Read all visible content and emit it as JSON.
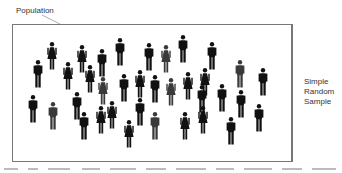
{
  "labels": {
    "population": "Population",
    "sample_lines": [
      "Simple",
      "Random",
      "Sample"
    ]
  },
  "colors": {
    "figure_dark": "#111111",
    "figure_gray": "#3a3a3a",
    "border": "#777777",
    "text": "#333333"
  },
  "figures": [
    {
      "type": "man",
      "x": 33,
      "y": 60,
      "shade": "dark"
    },
    {
      "type": "woman",
      "x": 47,
      "y": 42,
      "shade": "dark"
    },
    {
      "type": "woman",
      "x": 63,
      "y": 62,
      "shade": "dark"
    },
    {
      "type": "woman",
      "x": 77,
      "y": 45,
      "shade": "dark"
    },
    {
      "type": "woman",
      "x": 85,
      "y": 65,
      "shade": "dark"
    },
    {
      "type": "man",
      "x": 97,
      "y": 49,
      "shade": "dark"
    },
    {
      "type": "man",
      "x": 115,
      "y": 38,
      "shade": "dark"
    },
    {
      "type": "woman",
      "x": 98,
      "y": 77,
      "shade": "gray"
    },
    {
      "type": "man",
      "x": 119,
      "y": 74,
      "shade": "dark"
    },
    {
      "type": "woman",
      "x": 135,
      "y": 70,
      "shade": "dark"
    },
    {
      "type": "man",
      "x": 144,
      "y": 43,
      "shade": "dark"
    },
    {
      "type": "woman",
      "x": 161,
      "y": 45,
      "shade": "gray"
    },
    {
      "type": "man",
      "x": 150,
      "y": 75,
      "shade": "dark"
    },
    {
      "type": "woman",
      "x": 166,
      "y": 78,
      "shade": "gray"
    },
    {
      "type": "man",
      "x": 178,
      "y": 35,
      "shade": "dark"
    },
    {
      "type": "woman",
      "x": 183,
      "y": 72,
      "shade": "dark"
    },
    {
      "type": "man",
      "x": 207,
      "y": 42,
      "shade": "dark"
    },
    {
      "type": "man",
      "x": 197,
      "y": 85,
      "shade": "dark"
    },
    {
      "type": "woman",
      "x": 200,
      "y": 68,
      "shade": "dark"
    },
    {
      "type": "man",
      "x": 217,
      "y": 84,
      "shade": "dark"
    },
    {
      "type": "man",
      "x": 235,
      "y": 60,
      "shade": "gray"
    },
    {
      "type": "man",
      "x": 258,
      "y": 68,
      "shade": "dark"
    },
    {
      "type": "man",
      "x": 236,
      "y": 90,
      "shade": "dark"
    },
    {
      "type": "man",
      "x": 28,
      "y": 95,
      "shade": "dark"
    },
    {
      "type": "man",
      "x": 48,
      "y": 102,
      "shade": "gray"
    },
    {
      "type": "man",
      "x": 72,
      "y": 92,
      "shade": "dark"
    },
    {
      "type": "man",
      "x": 79,
      "y": 112,
      "shade": "dark"
    },
    {
      "type": "woman",
      "x": 96,
      "y": 106,
      "shade": "dark"
    },
    {
      "type": "woman",
      "x": 107,
      "y": 101,
      "shade": "dark"
    },
    {
      "type": "man",
      "x": 135,
      "y": 98,
      "shade": "dark"
    },
    {
      "type": "woman",
      "x": 124,
      "y": 120,
      "shade": "dark"
    },
    {
      "type": "man",
      "x": 150,
      "y": 112,
      "shade": "gray"
    },
    {
      "type": "woman",
      "x": 180,
      "y": 112,
      "shade": "dark"
    },
    {
      "type": "woman",
      "x": 198,
      "y": 106,
      "shade": "dark"
    },
    {
      "type": "man",
      "x": 226,
      "y": 117,
      "shade": "dark"
    },
    {
      "type": "man",
      "x": 254,
      "y": 104,
      "shade": "dark"
    }
  ]
}
